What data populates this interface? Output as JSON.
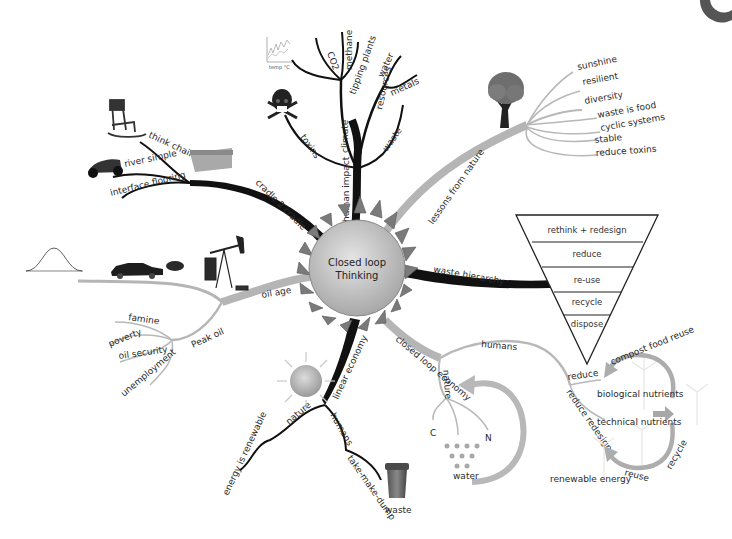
{
  "center": {
    "line1": "Closed loop",
    "line2": "Thinking"
  },
  "colors": {
    "dark_branch": "#111111",
    "light_branch": "#b5b5b5",
    "sun_core": "#c8c8c8",
    "sun_spike": "#707070"
  },
  "branches": {
    "human_impact": {
      "label": "human impact",
      "climate": {
        "label": "climate",
        "children": [
          "CO2",
          "methane",
          "tipping plants"
        ]
      },
      "resources": {
        "label": "resources",
        "children": [
          "water",
          "metals"
        ]
      },
      "toxins": "toxins",
      "waste": "waste",
      "chart_icon_label": "temp °C"
    },
    "lessons_from_nature": {
      "label": "lessons from nature",
      "children": [
        "sunshine",
        "resilient",
        "diversity",
        "waste is food",
        "cyclic systems",
        "stable",
        "reduce toxins"
      ]
    },
    "waste_hierarchy": {
      "label": "waste hierarchy",
      "levels": [
        "rethink + redesign",
        "reduce",
        "re-use",
        "recycle",
        "dispose"
      ]
    },
    "closed_loop_economy": {
      "label": "closed loop economy",
      "nature": {
        "label": "nature",
        "children": [
          "C",
          "N"
        ],
        "water_label": "water"
      },
      "humans": {
        "label": "humans",
        "reduce": "reduce",
        "reduce_redesign": "reduce redesign"
      },
      "cycle": {
        "biological": "biological nutrients",
        "technical": "technical nutrients",
        "top_arc": "compost food reuse",
        "right_arc": "recycle",
        "bottom_arc": "reuse",
        "energy": "renewable energy"
      }
    },
    "linear_economy": {
      "label": "linear economy",
      "nature": {
        "label": "nature",
        "child": "energy is renewable"
      },
      "humans": {
        "label": "humans",
        "child": "take-make-dump",
        "bin_label": "waste"
      }
    },
    "oil_age": {
      "label": "oil age",
      "peak_oil": {
        "label": "Peak oil",
        "children": [
          "famine",
          "poverty",
          "oil security",
          "unemployment"
        ]
      }
    },
    "cradle_2_cradle": {
      "label": "cradle 2 cradle",
      "children": [
        "think chair",
        "river simple",
        "interface flooring"
      ]
    }
  }
}
